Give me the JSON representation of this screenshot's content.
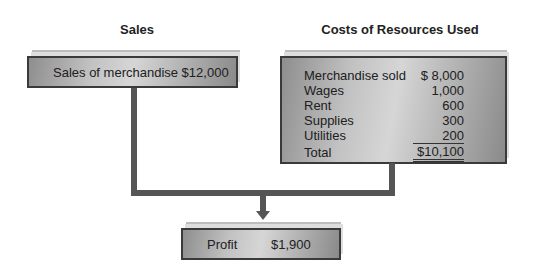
{
  "headings": {
    "sales": "Sales",
    "costs": "Costs of Resources Used"
  },
  "sales_box": {
    "label": "Sales of merchandise $12,000"
  },
  "costs_box": {
    "items": [
      {
        "label": "Merchandise sold",
        "amount": "$ 8,000"
      },
      {
        "label": "Wages",
        "amount": "1,000"
      },
      {
        "label": "Rent",
        "amount": "600"
      },
      {
        "label": "Supplies",
        "amount": "300"
      },
      {
        "label": "Utilities",
        "amount": "200"
      }
    ],
    "total": {
      "label": "Total",
      "amount": "$10,100"
    }
  },
  "profit_box": {
    "label": "Profit",
    "amount": "$1,900"
  }
}
